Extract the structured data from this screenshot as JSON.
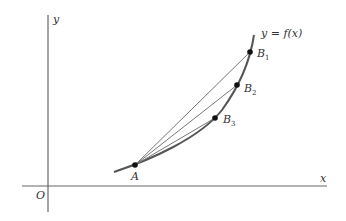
{
  "diagram": {
    "axes": {
      "x_label": "x",
      "y_label": "y",
      "origin_label": "O"
    },
    "curve_label": "y = f(x)",
    "points": [
      {
        "id": "A",
        "label": "A",
        "sub": ""
      },
      {
        "id": "B1",
        "label": "B",
        "sub": "1"
      },
      {
        "id": "B2",
        "label": "B",
        "sub": "2"
      },
      {
        "id": "B3",
        "label": "B",
        "sub": "3"
      }
    ],
    "colors": {
      "axis": "#666666",
      "curve": "#555555",
      "secant": "#777777",
      "point": "#111111"
    }
  }
}
